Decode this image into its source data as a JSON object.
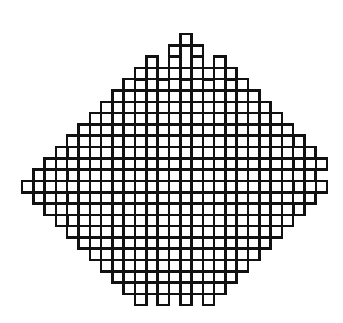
{
  "figure": {
    "kind": "fractal-pattern"
  },
  "canvas": {
    "width": 343,
    "height": 323,
    "background_color": "#ffffff"
  },
  "pattern": {
    "stroke_color": "#111111",
    "stroke_width": 2.6,
    "cell_size": 11.3,
    "origin_x": 22.0,
    "origin_y": 34.0,
    "grid_cols": 27,
    "grid_rows": 24,
    "rule": 90,
    "description": "Each live cell is drawn as a square outline of one cell-size; neighbouring live cells share edges so the union reads as interlocking crosses.",
    "grid": [
      "000000000000001000000000000",
      "000000000000010100000000000",
      "000000000001010101000000000",
      "000000000010101010100000000",
      "000000000101010101010000000",
      "000000001010101010101000000",
      "000000010101010101010100000",
      "000000101010101010101010000",
      "000001010101010101010101000",
      "000010101010101010101010100",
      "000101010101010101010101010",
      "001010101010101010101010101",
      "010101010101010101010101010",
      "101010101010101010101010101",
      "010101010101010101010101010",
      "001010101010101010101010100",
      "000101010101010101010101000",
      "000010101010101010101010000",
      "000001010101010101010100000",
      "000000101010101010101000000",
      "000000010101010101010000000",
      "000000001010101010100000000",
      "000000000101010101000000000",
      "000000000010101010000000000"
    ],
    "lobes": [
      {
        "name": "top-left-lobe",
        "center_x": 108,
        "center_y": 110
      },
      {
        "name": "top-right-lobe",
        "center_x": 240,
        "center_y": 108
      },
      {
        "name": "bottom-left-lobe",
        "center_x": 104,
        "center_y": 228
      },
      {
        "name": "bottom-right-lobe",
        "center_x": 240,
        "center_y": 230
      }
    ]
  }
}
